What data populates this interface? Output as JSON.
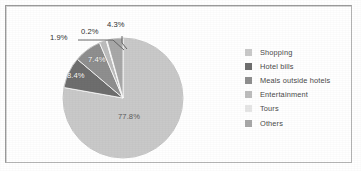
{
  "figure": {
    "background_color": "#ffffff",
    "border_color": "#9a9a9a"
  },
  "chart_data": {
    "type": "pie",
    "title": "",
    "subtitle": "",
    "xlabel": "",
    "ylabel": "",
    "legend_position": "right",
    "grid": false,
    "start_angle_deg": 0,
    "direction": "clockwise",
    "categories": [
      "Shopping",
      "Hotel bills",
      "Meals outside hotels",
      "Entertainment",
      "Tours",
      "Others"
    ],
    "values": [
      77.8,
      8.4,
      7.4,
      1.9,
      0.2,
      4.3
    ],
    "value_unit": "%",
    "data_labels": [
      "77.8%",
      "8.4%",
      "7.4%",
      "1.9%",
      "0.2%",
      "4.3%"
    ],
    "colors": [
      "#c9c9c9",
      "#6e6e6e",
      "#8f8f8f",
      "#bdbdbd",
      "#e6e6e6",
      "#a8a8a8"
    ],
    "total": 100.0,
    "slices": [
      {
        "label": "Shopping",
        "value": 77.8,
        "data_label": "77.8%",
        "color": "#c9c9c9",
        "label_placement": "inside"
      },
      {
        "label": "Hotel bills",
        "value": 8.4,
        "data_label": "8.4%",
        "color": "#6e6e6e",
        "label_placement": "inside"
      },
      {
        "label": "Meals outside hotels",
        "value": 7.4,
        "data_label": "7.4%",
        "color": "#8f8f8f",
        "label_placement": "inside"
      },
      {
        "label": "Entertainment",
        "value": 1.9,
        "data_label": "1.9%",
        "color": "#bdbdbd",
        "label_placement": "outside-leader"
      },
      {
        "label": "Tours",
        "value": 0.2,
        "data_label": "0.2%",
        "color": "#e6e6e6",
        "label_placement": "outside-leader"
      },
      {
        "label": "Others",
        "value": 4.3,
        "data_label": "4.3%",
        "color": "#a8a8a8",
        "label_placement": "outside"
      }
    ]
  },
  "legend": {
    "items": [
      {
        "label": "Shopping",
        "color": "#c9c9c9"
      },
      {
        "label": "Hotel bills",
        "color": "#6e6e6e"
      },
      {
        "label": "Meals outside hotels",
        "color": "#8f8f8f"
      },
      {
        "label": "Entertainment",
        "color": "#bdbdbd"
      },
      {
        "label": "Tours",
        "color": "#e6e6e6"
      },
      {
        "label": "Others",
        "color": "#a8a8a8"
      }
    ]
  },
  "labels": {
    "pct_shopping": "77.8%",
    "pct_hotel_bills": "8.4%",
    "pct_meals": "7.4%",
    "pct_entertainment": "1.9%",
    "pct_tours": "0.2%",
    "pct_others": "4.3%"
  }
}
